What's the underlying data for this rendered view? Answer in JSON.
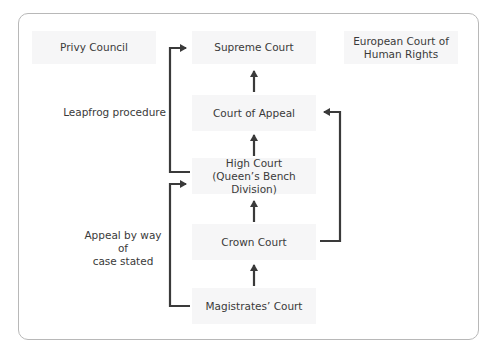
{
  "diagram": {
    "type": "court-hierarchy",
    "courts": {
      "privy_council": "Privy Council",
      "supreme_court": "Supreme Court",
      "echr": "European Court of Human Rights",
      "echr_line1": "European Court of",
      "echr_line2": "Human Rights",
      "court_of_appeal": "Court of Appeal",
      "high_court_line1": "High Court",
      "high_court_line2": "(Queen’s Bench Division)",
      "crown_court": "Crown Court",
      "magistrates_court": "Magistrates’ Court"
    },
    "routes": {
      "leapfrog": "Leapfrog procedure",
      "case_stated_line1": "Appeal by way of",
      "case_stated_line2": "case stated"
    },
    "colors": {
      "arrow": "#3a3a3a",
      "box_fill": "#f6f6f7",
      "frame_border": "#b8b8b8",
      "text": "#3a3a3a"
    }
  }
}
